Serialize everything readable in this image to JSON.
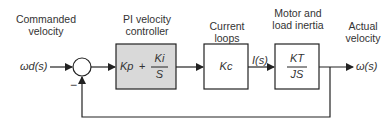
{
  "diagram": {
    "type": "block-diagram",
    "labels": {
      "commanded": "Commanded velocity",
      "pi_controller": "PI velocity controller",
      "current_loops": "Current loops",
      "motor_inertia": "Motor and load inertia",
      "actual": "Actual velocity"
    },
    "signals": {
      "input": "ωd(s)",
      "current": "I(s)",
      "output": "ω(s)",
      "feedback_sign": "−"
    },
    "blocks": {
      "pi": {
        "kp": "Kp",
        "plus": "+",
        "ki": "Ki",
        "s": "S",
        "fill": "#d9d9d9"
      },
      "current": {
        "gain": "Kc"
      },
      "plant": {
        "num": "KT",
        "den": "JS"
      }
    }
  }
}
